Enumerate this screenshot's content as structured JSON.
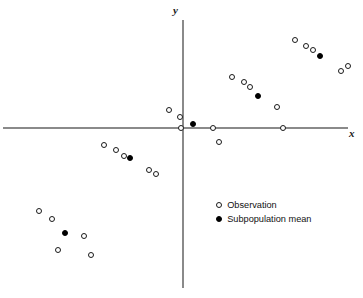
{
  "chart_data": {
    "type": "scatter",
    "title": "",
    "subtitle": "",
    "xlabel": "x",
    "ylabel": "y",
    "xlim": [
      -183,
      180
    ],
    "ylim": [
      -161,
      107
    ],
    "grid": false,
    "axes_style": "centered-cross-through-origin",
    "legend_position": "inside-lower-right",
    "legend": [
      {
        "key": "observation",
        "label": "Observation",
        "marker": "open-circle",
        "color": "#ffffff",
        "edge_color": "#1a1a1a"
      },
      {
        "key": "subpopulation-mean",
        "label": "Subpopulation mean",
        "marker": "filled-circle",
        "color": "#000000",
        "edge_color": "#000000"
      }
    ],
    "series": [
      {
        "name": "Observation",
        "marker": "open-circle",
        "points": [
          {
            "px": 295,
            "py": 40
          },
          {
            "px": 306,
            "py": 46
          },
          {
            "px": 313,
            "py": 50
          },
          {
            "px": 341,
            "py": 71
          },
          {
            "px": 348,
            "py": 66
          },
          {
            "px": 232,
            "py": 77
          },
          {
            "px": 244,
            "py": 82
          },
          {
            "px": 250,
            "py": 87
          },
          {
            "px": 277,
            "py": 107
          },
          {
            "px": 283,
            "py": 128
          },
          {
            "px": 169,
            "py": 110
          },
          {
            "px": 180,
            "py": 117
          },
          {
            "px": 181,
            "py": 128
          },
          {
            "px": 213,
            "py": 128
          },
          {
            "px": 219,
            "py": 142
          },
          {
            "px": 104,
            "py": 145
          },
          {
            "px": 116,
            "py": 150
          },
          {
            "px": 124,
            "py": 156
          },
          {
            "px": 149,
            "py": 170
          },
          {
            "px": 156,
            "py": 174
          },
          {
            "px": 39,
            "py": 211
          },
          {
            "px": 52,
            "py": 219
          },
          {
            "px": 84,
            "py": 236
          },
          {
            "px": 58,
            "py": 250
          },
          {
            "px": 91,
            "py": 255
          }
        ]
      },
      {
        "name": "Subpopulation mean",
        "marker": "filled-circle",
        "points": [
          {
            "px": 320,
            "py": 56
          },
          {
            "px": 258,
            "py": 96
          },
          {
            "px": 193,
            "py": 124
          },
          {
            "px": 130,
            "py": 158
          },
          {
            "px": 65,
            "py": 233
          }
        ]
      }
    ],
    "annotations": []
  },
  "figure": {
    "background": "#ffffff",
    "axis_color": "#8a8a8a",
    "marker_edge_color": "#1a1a1a",
    "marker_fill_color": "#000000",
    "width": 363,
    "height": 298
  }
}
